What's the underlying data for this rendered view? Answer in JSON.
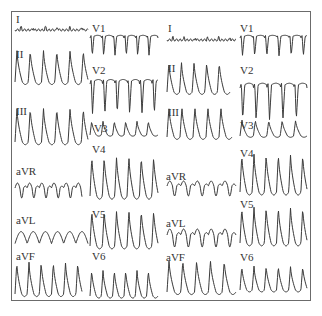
{
  "figure": {
    "panels": [
      {
        "id": "left",
        "leads_col1": [
          "I",
          "II",
          "III",
          "aVR",
          "aVL",
          "aVF"
        ],
        "leads_col2": [
          "V1",
          "V2",
          "V3",
          "V4",
          "V5",
          "V6"
        ]
      },
      {
        "id": "right",
        "leads_col1": [
          "I",
          "II",
          "III",
          "aVR",
          "aVL",
          "aVF"
        ],
        "leads_col2": [
          "V1",
          "V2",
          "V3",
          "V4",
          "V5",
          "V6"
        ]
      }
    ]
  },
  "colors": {
    "trace": "#3a3a3a",
    "border": "#6b6b6b",
    "background": "#ffffff"
  }
}
